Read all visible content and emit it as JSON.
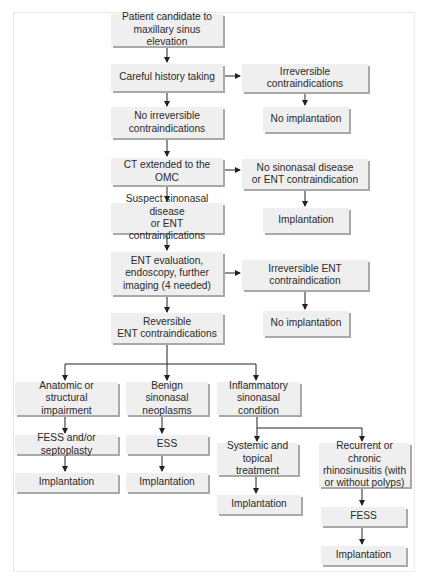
{
  "diagram": {
    "type": "flowchart",
    "nodes": {
      "start": "Patient candidate to\nmaxillary sinus elevation",
      "history": "Careful history taking",
      "irreversible": "Irreversible contraindications",
      "no_impl_1": "No implantation",
      "no_irreversible": "No irreversible\ncontraindications",
      "ct": "CT extended to the OMC",
      "no_sinonasal": "No sinonasal disease\nor ENT contraindication",
      "impl_1": "Implantation",
      "suspect": "Suspect sinonasal disease\nor ENT contraindications",
      "ent_eval": "ENT evaluation,\nendoscopy, further\nimaging (4 needed)",
      "irreversible_ent": "Irreversible ENT\ncontraindication",
      "no_impl_2": "No implantation",
      "reversible_ent": "Reversible\nENT contraindications",
      "anatomic": "Anatomic or structural\nimpairment",
      "benign": "Benign sinonasal\nneoplasms",
      "inflammatory": "Inflammatory\nsinonasal condition",
      "fess_septo": "FESS and/or septoplasty",
      "ess": "ESS",
      "systemic": "Systemic and\ntopical treatment",
      "recurrent": "Recurrent or chronic\nrhinosinusitis (with\nor without polyps)",
      "impl_anatomic": "Implantation",
      "impl_benign": "Implantation",
      "impl_systemic": "Implantation",
      "fess": "FESS",
      "impl_recurrent": "Implantation"
    },
    "edges": [
      [
        "start",
        "history"
      ],
      [
        "history",
        "irreversible"
      ],
      [
        "irreversible",
        "no_impl_1"
      ],
      [
        "history",
        "no_irreversible"
      ],
      [
        "no_irreversible",
        "ct"
      ],
      [
        "ct",
        "no_sinonasal"
      ],
      [
        "no_sinonasal",
        "impl_1"
      ],
      [
        "ct",
        "suspect"
      ],
      [
        "suspect",
        "ent_eval"
      ],
      [
        "ent_eval",
        "irreversible_ent"
      ],
      [
        "irreversible_ent",
        "no_impl_2"
      ],
      [
        "ent_eval",
        "reversible_ent"
      ],
      [
        "reversible_ent",
        "anatomic"
      ],
      [
        "reversible_ent",
        "benign"
      ],
      [
        "reversible_ent",
        "inflammatory"
      ],
      [
        "anatomic",
        "fess_septo"
      ],
      [
        "fess_septo",
        "impl_anatomic"
      ],
      [
        "benign",
        "ess"
      ],
      [
        "ess",
        "impl_benign"
      ],
      [
        "inflammatory",
        "systemic"
      ],
      [
        "inflammatory",
        "recurrent"
      ],
      [
        "systemic",
        "impl_systemic"
      ],
      [
        "recurrent",
        "fess"
      ],
      [
        "fess",
        "impl_recurrent"
      ]
    ],
    "colors": {
      "box_fill": "#efefef",
      "box_shadow": "#a9a9a9",
      "text": "#2a2a2a",
      "arrow": "#222222"
    }
  }
}
